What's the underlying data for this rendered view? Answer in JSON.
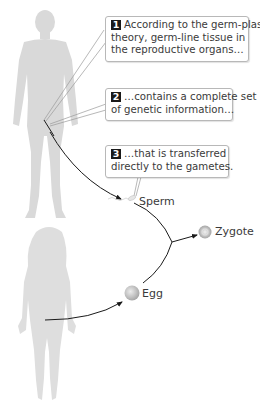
{
  "callouts": [
    {
      "number": "1",
      "lines": [
        "According to the germ-plasm",
        "theory, germ-line tissue in",
        "the reproductive organs…"
      ]
    },
    {
      "number": "2",
      "lines": [
        "…contains a complete set",
        "of genetic information…"
      ]
    },
    {
      "number": "3",
      "lines": [
        "…that is transferred",
        "directly to the gametes."
      ]
    }
  ],
  "labels": {
    "sperm": "Sperm",
    "egg": "Egg",
    "zygote": "Zygote"
  },
  "colors": {
    "silhouette": "#d9d9d9",
    "arrow": "#1a1a1a",
    "callout_border": "#b8b8b8",
    "number_badge": "#1a1a1a",
    "cell": "#c8c8c8"
  }
}
